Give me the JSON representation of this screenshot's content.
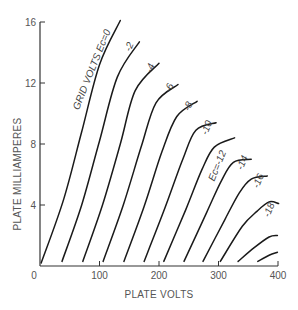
{
  "chart_data": {
    "type": "line",
    "title": "",
    "xlabel": "PLATE VOLTS",
    "ylabel": "PLATE MILLIAMPERES",
    "xlim": [
      0,
      400
    ],
    "ylim": [
      0,
      16
    ],
    "x_ticks": [
      0,
      100,
      200,
      300,
      400
    ],
    "y_ticks": [
      0,
      4,
      8,
      12,
      16
    ],
    "grid": false,
    "legend": "inline curve labels",
    "annotation": "GRID VOLTS E_c=0",
    "series": [
      {
        "name": "0",
        "label": "GRID VOLTS Ec=0",
        "points": [
          [
            2,
            0.2
          ],
          [
            40,
            4.4
          ],
          [
            70,
            8.8
          ],
          [
            100,
            13.2
          ],
          [
            135,
            16.1
          ]
        ]
      },
      {
        "name": "-2",
        "label": "-2",
        "points": [
          [
            37,
            0.3
          ],
          [
            70,
            4.0
          ],
          [
            100,
            8.2
          ],
          [
            130,
            12.4
          ],
          [
            167,
            14.7
          ]
        ]
      },
      {
        "name": "-4",
        "label": "-4",
        "points": [
          [
            72,
            0.3
          ],
          [
            105,
            4.0
          ],
          [
            135,
            8.0
          ],
          [
            160,
            11.5
          ],
          [
            200,
            13.3
          ]
        ]
      },
      {
        "name": "-6",
        "label": "-6",
        "points": [
          [
            106,
            0.3
          ],
          [
            140,
            4.0
          ],
          [
            170,
            7.8
          ],
          [
            195,
            10.7
          ],
          [
            232,
            11.9
          ]
        ]
      },
      {
        "name": "-8",
        "label": "-8",
        "points": [
          [
            141,
            0.3
          ],
          [
            175,
            3.9
          ],
          [
            205,
            7.5
          ],
          [
            230,
            9.8
          ],
          [
            264,
            10.8
          ]
        ]
      },
      {
        "name": "-10",
        "label": "-10",
        "points": [
          [
            175,
            0.3
          ],
          [
            210,
            3.8
          ],
          [
            240,
            7.0
          ],
          [
            262,
            8.9
          ],
          [
            296,
            9.4
          ]
        ]
      },
      {
        "name": "-12",
        "label": "Ec=-12",
        "points": [
          [
            208,
            0.3
          ],
          [
            245,
            3.7
          ],
          [
            272,
            6.3
          ],
          [
            293,
            7.8
          ],
          [
            327,
            8.4
          ]
        ]
      },
      {
        "name": "-14",
        "label": "-14",
        "points": [
          [
            242,
            0.3
          ],
          [
            280,
            3.5
          ],
          [
            305,
            5.6
          ],
          [
            325,
            6.8
          ],
          [
            355,
            7.0
          ]
        ]
      },
      {
        "name": "-16",
        "label": "-16",
        "points": [
          [
            274,
            0.3
          ],
          [
            310,
            3.0
          ],
          [
            335,
            4.8
          ],
          [
            355,
            5.7
          ],
          [
            382,
            5.9
          ]
        ]
      },
      {
        "name": "-18",
        "label": "-18",
        "points": [
          [
            303,
            0.3
          ],
          [
            340,
            2.6
          ],
          [
            365,
            3.6
          ],
          [
            385,
            4.2
          ],
          [
            401,
            4.1
          ]
        ]
      },
      {
        "name": "-20",
        "label": "",
        "points": [
          [
            333,
            0.3
          ],
          [
            360,
            1.2
          ],
          [
            385,
            1.9
          ],
          [
            399,
            2.0
          ]
        ]
      },
      {
        "name": "-22",
        "label": "",
        "points": [
          [
            366,
            0.3
          ],
          [
            385,
            0.7
          ],
          [
            399,
            0.9
          ]
        ]
      }
    ],
    "labels": [
      {
        "text": "GRID VOLTS Ec=0",
        "x": 92,
        "y": 12.8,
        "rotate": -68
      },
      {
        "text": "-2",
        "x": 155,
        "y": 14.3,
        "rotate": -68
      },
      {
        "text": "-4",
        "x": 190,
        "y": 12.9,
        "rotate": -68
      },
      {
        "text": "-6",
        "x": 222,
        "y": 11.6,
        "rotate": -68
      },
      {
        "text": "-8",
        "x": 254,
        "y": 10.4,
        "rotate": -68
      },
      {
        "text": "-10",
        "x": 285,
        "y": 9.0,
        "rotate": -68
      },
      {
        "text": "Ec=-12",
        "x": 303,
        "y": 6.5,
        "rotate": -68
      },
      {
        "text": "-14",
        "x": 345,
        "y": 6.7,
        "rotate": -68
      },
      {
        "text": "-16",
        "x": 372,
        "y": 5.5,
        "rotate": -68
      },
      {
        "text": "-18",
        "x": 390,
        "y": 3.6,
        "rotate": -68
      }
    ]
  },
  "axes": {
    "x_title": "PLATE VOLTS",
    "y_title": "PLATE MILLIAMPERES",
    "x_tick_labels": [
      "0",
      "100",
      "200",
      "300",
      "400"
    ],
    "y_tick_labels": [
      "0",
      "4",
      "8",
      "12",
      "16"
    ]
  },
  "colors": {
    "curve": "#1a1a1a",
    "axis": "#333333",
    "text": "#555555"
  }
}
